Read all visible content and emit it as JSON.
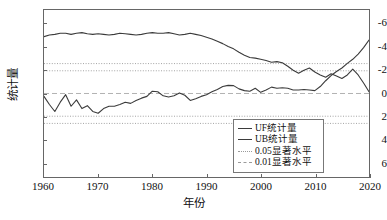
{
  "chart_data": {
    "type": "line",
    "title": "",
    "xlabel": "年份",
    "ylabel": "统计量",
    "xlim": [
      1960,
      2020
    ],
    "ylim": [
      -7.2,
      7.2
    ],
    "xticks": [
      1960,
      1970,
      1980,
      1990,
      2000,
      2010,
      2020
    ],
    "yticks": [
      -6,
      -4,
      -2,
      0,
      2,
      4,
      6
    ],
    "grid": false,
    "legend_position": "lower-right",
    "series": [
      {
        "name": "UF统计量",
        "style": "solid",
        "color": "#3b3b3b",
        "x": [
          1960,
          1961,
          1962,
          1963,
          1964,
          1965,
          1966,
          1967,
          1968,
          1969,
          1970,
          1971,
          1972,
          1973,
          1974,
          1975,
          1976,
          1977,
          1978,
          1979,
          1980,
          1981,
          1982,
          1983,
          1984,
          1985,
          1986,
          1987,
          1988,
          1989,
          1990,
          1991,
          1992,
          1993,
          1994,
          1995,
          1996,
          1997,
          1998,
          1999,
          2000,
          2001,
          2002,
          2003,
          2004,
          2005,
          2006,
          2007,
          2008,
          2009,
          2010,
          2011,
          2012,
          2013,
          2014,
          2015,
          2016,
          2017,
          2018,
          2019,
          2020
        ],
        "y": [
          -0.25,
          -0.95,
          -1.55,
          -0.75,
          -0.1,
          -1.1,
          -0.55,
          -1.3,
          -1.05,
          -1.55,
          -1.7,
          -1.3,
          -1.1,
          -1.1,
          -0.95,
          -0.75,
          -0.85,
          -0.6,
          -0.4,
          -0.25,
          0.2,
          0.15,
          -0.2,
          -0.3,
          -0.2,
          0.05,
          -0.15,
          -0.6,
          -0.45,
          -0.25,
          -0.1,
          0.15,
          0.35,
          0.6,
          0.7,
          0.68,
          0.4,
          0.25,
          0.2,
          0.45,
          0.1,
          0.3,
          0.55,
          0.45,
          0.5,
          0.45,
          0.3,
          0.3,
          0.35,
          0.3,
          0.25,
          0.6,
          1.1,
          1.55,
          1.9,
          2.2,
          2.6,
          2.95,
          3.4,
          3.95,
          4.6
        ]
      },
      {
        "name": "UB统计量",
        "style": "solid",
        "color": "#3b3b3b",
        "x": [
          1960,
          1961,
          1962,
          1963,
          1964,
          1965,
          1966,
          1967,
          1968,
          1969,
          1970,
          1971,
          1972,
          1973,
          1974,
          1975,
          1976,
          1977,
          1978,
          1979,
          1980,
          1981,
          1982,
          1983,
          1984,
          1985,
          1986,
          1987,
          1988,
          1989,
          1990,
          1991,
          1992,
          1993,
          1994,
          1995,
          1996,
          1997,
          1998,
          1999,
          2000,
          2001,
          2002,
          2003,
          2004,
          2005,
          2006,
          2007,
          2008,
          2009,
          2010,
          2011,
          2012,
          2013,
          2014,
          2015,
          2016,
          2017,
          2018,
          2019,
          2020
        ],
        "y": [
          4.9,
          5.05,
          5.1,
          5.2,
          5.2,
          5.1,
          5.2,
          5.25,
          5.15,
          5.1,
          5.15,
          5.1,
          5.05,
          5.1,
          5.2,
          5.15,
          5.1,
          5.05,
          5.1,
          5.2,
          5.25,
          5.2,
          5.2,
          5.25,
          5.15,
          5.05,
          5.1,
          5.2,
          5.1,
          5.0,
          4.85,
          4.7,
          4.5,
          4.3,
          4.05,
          3.85,
          3.55,
          3.3,
          3.1,
          3.05,
          2.95,
          2.85,
          2.7,
          2.75,
          2.65,
          2.35,
          2.0,
          1.75,
          2.0,
          2.2,
          1.85,
          1.6,
          1.4,
          1.7,
          1.5,
          1.3,
          1.6,
          2.1,
          1.6,
          0.9,
          0.15
        ]
      }
    ],
    "reference_lines": [
      {
        "name": "0.05显著水平",
        "style": "dotted",
        "color": "#9a9a9a",
        "values": [
          1.96,
          -1.96
        ]
      },
      {
        "name": "0.01显著水平",
        "style": "dotted",
        "color": "#9a9a9a",
        "values": [
          2.58,
          -2.58
        ]
      },
      {
        "name": "zero-line",
        "style": "dashed",
        "color": "#b3b3b3",
        "values": [
          0
        ]
      }
    ]
  },
  "axes": {
    "y_title": "统计量",
    "x_title": "年份",
    "y_tick_labels": [
      "6",
      "4",
      "2",
      "0",
      "-2",
      "-4",
      "-6"
    ],
    "x_tick_labels": [
      "1960",
      "1970",
      "1980",
      "1990",
      "2000",
      "2010",
      "2020"
    ]
  },
  "legend": {
    "items": [
      {
        "label": "UF统计量",
        "key": "solid-dark"
      },
      {
        "label": "UB统计量",
        "key": "solid-dark2"
      },
      {
        "label": "0.05显著水平",
        "key": "dotted-a"
      },
      {
        "label": "0.01显著水平",
        "key": "dotted-b"
      }
    ]
  }
}
